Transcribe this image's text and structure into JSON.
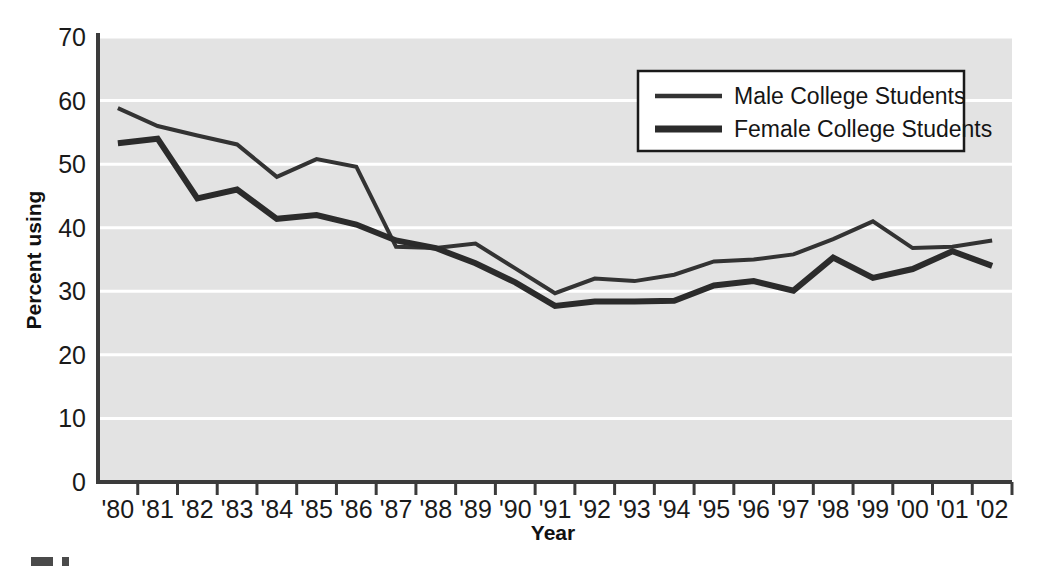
{
  "chart_data": {
    "type": "line",
    "title": "",
    "subtitle": "",
    "xlabel": "Year",
    "ylabel": "Percent using",
    "xlim": [
      1980,
      2002
    ],
    "ylim": [
      0,
      70
    ],
    "yticks": [
      0,
      10,
      20,
      30,
      40,
      50,
      60,
      70
    ],
    "ytick_labels": [
      "0",
      "10",
      "20",
      "30",
      "40",
      "50",
      "60",
      "70"
    ],
    "grid": "horizontal",
    "plot_background": "#e3e3e3",
    "legend_position": "top-right",
    "categories": [
      "'80",
      "'81",
      "'82",
      "'83",
      "'84",
      "'85",
      "'86",
      "'87",
      "'88",
      "'89",
      "'90",
      "'91",
      "'92",
      "'93",
      "'94",
      "'95",
      "'96",
      "'97",
      "'98",
      "'99",
      "'00",
      "'01",
      "'02"
    ],
    "x": [
      1980,
      1981,
      1982,
      1983,
      1984,
      1985,
      1986,
      1987,
      1988,
      1989,
      1990,
      1991,
      1992,
      1993,
      1994,
      1995,
      1996,
      1997,
      1998,
      1999,
      2000,
      2001,
      2002
    ],
    "series": [
      {
        "name": "Male College Students",
        "color": "#333333",
        "linewidth": 4,
        "values": [
          58.8,
          56.0,
          54.5,
          53.1,
          48.0,
          50.8,
          49.6,
          37.0,
          36.8,
          37.5,
          33.6,
          29.7,
          32.0,
          31.6,
          32.6,
          34.7,
          35.0,
          35.8,
          38.2,
          41.0,
          36.8,
          37.0,
          38.0
        ]
      },
      {
        "name": "Female College Students",
        "color": "#2b2b2b",
        "linewidth": 6,
        "values": [
          53.3,
          54.0,
          44.6,
          46.0,
          41.4,
          42.0,
          40.5,
          38.0,
          36.8,
          34.4,
          31.4,
          27.7,
          28.4,
          28.4,
          28.5,
          30.9,
          31.6,
          30.1,
          35.3,
          32.1,
          33.5,
          36.3,
          34.0
        ]
      }
    ],
    "annotations": []
  },
  "legend": {
    "entries": [
      {
        "label": "Male College Students",
        "swatch": "thin-line-swatch"
      },
      {
        "label": "Female College Students",
        "swatch": "thick-line-swatch"
      }
    ]
  },
  "axes": {
    "y_title": "Percent using",
    "x_title": "Year"
  },
  "caption": {
    "text": ""
  },
  "colors": {
    "plot_bg": "#e3e3e3",
    "page_bg": "#ffffff",
    "gridline": "#ffffff",
    "axis": "#3b3b3b",
    "line_male": "#333333",
    "line_female": "#2b2b2b",
    "text": "#111111"
  }
}
